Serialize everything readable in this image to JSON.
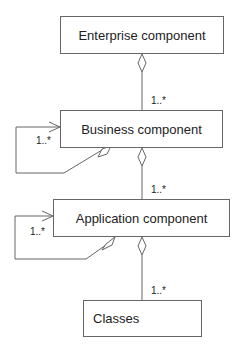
{
  "diagram": {
    "type": "UML aggregation hierarchy",
    "nodes": [
      {
        "id": "enterprise",
        "label": "Enterprise component"
      },
      {
        "id": "business",
        "label": "Business component"
      },
      {
        "id": "application",
        "label": "Application component"
      },
      {
        "id": "classes",
        "label": "Classes"
      }
    ],
    "edges": [
      {
        "from": "enterprise",
        "to": "business",
        "kind": "aggregation",
        "multiplicity": "1..*"
      },
      {
        "from": "business",
        "to": "business",
        "kind": "self-aggregation",
        "multiplicity": "1..*"
      },
      {
        "from": "business",
        "to": "application",
        "kind": "aggregation",
        "multiplicity": "1..*"
      },
      {
        "from": "application",
        "to": "application",
        "kind": "self-aggregation",
        "multiplicity": "1..*"
      },
      {
        "from": "application",
        "to": "classes",
        "kind": "aggregation",
        "multiplicity": "1..*"
      }
    ],
    "colors": {
      "line": "#666666",
      "text": "#222222",
      "background": "#ffffff"
    }
  }
}
